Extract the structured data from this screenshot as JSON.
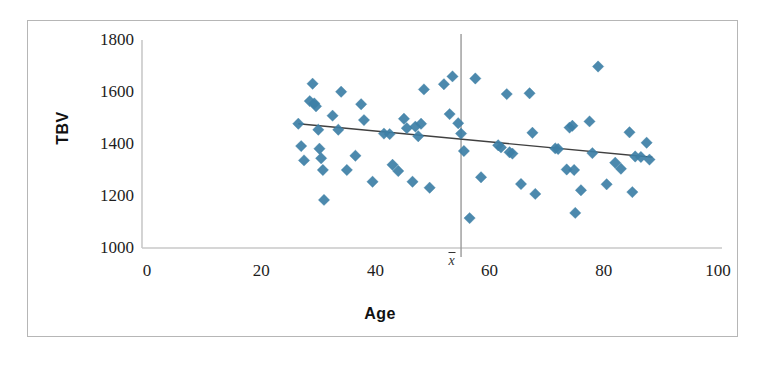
{
  "chart_data": {
    "type": "scatter",
    "title": "",
    "xlabel": "Age",
    "ylabel": "TBV",
    "xlim": [
      0,
      100
    ],
    "ylim": [
      1000,
      1800
    ],
    "xticks": [
      0,
      20,
      40,
      60,
      80,
      100
    ],
    "yticks": [
      1000,
      1200,
      1400,
      1600,
      1800
    ],
    "grid": false,
    "legend": false,
    "marker": "diamond",
    "marker_color": "#3d7fa6",
    "marker_size": 9,
    "annotations": [
      {
        "name": "x-bar-mean-line",
        "kind": "vertical-line",
        "x": 55,
        "label": "x̄",
        "color": "#9a9a9a"
      }
    ],
    "trendline": {
      "name": "regression-line",
      "kind": "line",
      "color": "#404040",
      "x": [
        26.5,
        88.5
      ],
      "y": [
        1478,
        1349
      ],
      "slope": -2.08,
      "intercept": 1533
    },
    "points": [
      {
        "x": 26.5,
        "y": 1478
      },
      {
        "x": 27.0,
        "y": 1392
      },
      {
        "x": 27.5,
        "y": 1337
      },
      {
        "x": 28.5,
        "y": 1565
      },
      {
        "x": 29.0,
        "y": 1632
      },
      {
        "x": 29.3,
        "y": 1556
      },
      {
        "x": 29.6,
        "y": 1545
      },
      {
        "x": 30.0,
        "y": 1455
      },
      {
        "x": 30.2,
        "y": 1382
      },
      {
        "x": 30.5,
        "y": 1345
      },
      {
        "x": 30.8,
        "y": 1300
      },
      {
        "x": 31.0,
        "y": 1185
      },
      {
        "x": 32.5,
        "y": 1509
      },
      {
        "x": 33.5,
        "y": 1455
      },
      {
        "x": 34.0,
        "y": 1601
      },
      {
        "x": 35.0,
        "y": 1300
      },
      {
        "x": 36.5,
        "y": 1355
      },
      {
        "x": 37.5,
        "y": 1553
      },
      {
        "x": 38.0,
        "y": 1492
      },
      {
        "x": 39.5,
        "y": 1255
      },
      {
        "x": 41.5,
        "y": 1440
      },
      {
        "x": 42.5,
        "y": 1438
      },
      {
        "x": 43.0,
        "y": 1320
      },
      {
        "x": 44.0,
        "y": 1296
      },
      {
        "x": 45.0,
        "y": 1497
      },
      {
        "x": 45.5,
        "y": 1461
      },
      {
        "x": 46.5,
        "y": 1255
      },
      {
        "x": 47.0,
        "y": 1467
      },
      {
        "x": 47.5,
        "y": 1430
      },
      {
        "x": 48.0,
        "y": 1478
      },
      {
        "x": 48.5,
        "y": 1610
      },
      {
        "x": 49.5,
        "y": 1232
      },
      {
        "x": 52.0,
        "y": 1630
      },
      {
        "x": 53.0,
        "y": 1515
      },
      {
        "x": 53.5,
        "y": 1660
      },
      {
        "x": 54.5,
        "y": 1480
      },
      {
        "x": 55.0,
        "y": 1440
      },
      {
        "x": 55.5,
        "y": 1373
      },
      {
        "x": 56.5,
        "y": 1115
      },
      {
        "x": 57.5,
        "y": 1652
      },
      {
        "x": 58.5,
        "y": 1272
      },
      {
        "x": 61.5,
        "y": 1395
      },
      {
        "x": 62.0,
        "y": 1387
      },
      {
        "x": 63.0,
        "y": 1592
      },
      {
        "x": 63.5,
        "y": 1368
      },
      {
        "x": 64.0,
        "y": 1363
      },
      {
        "x": 65.5,
        "y": 1246
      },
      {
        "x": 67.0,
        "y": 1595
      },
      {
        "x": 67.5,
        "y": 1443
      },
      {
        "x": 68.0,
        "y": 1208
      },
      {
        "x": 71.5,
        "y": 1383
      },
      {
        "x": 72.0,
        "y": 1381
      },
      {
        "x": 73.5,
        "y": 1302
      },
      {
        "x": 74.0,
        "y": 1463
      },
      {
        "x": 74.5,
        "y": 1470
      },
      {
        "x": 74.8,
        "y": 1300
      },
      {
        "x": 75.0,
        "y": 1135
      },
      {
        "x": 76.0,
        "y": 1222
      },
      {
        "x": 77.5,
        "y": 1487
      },
      {
        "x": 78.0,
        "y": 1365
      },
      {
        "x": 79.0,
        "y": 1698
      },
      {
        "x": 80.5,
        "y": 1245
      },
      {
        "x": 82.0,
        "y": 1328
      },
      {
        "x": 83.0,
        "y": 1305
      },
      {
        "x": 84.5,
        "y": 1445
      },
      {
        "x": 85.0,
        "y": 1215
      },
      {
        "x": 85.5,
        "y": 1352
      },
      {
        "x": 86.5,
        "y": 1350
      },
      {
        "x": 87.5,
        "y": 1405
      },
      {
        "x": 88.0,
        "y": 1340
      }
    ]
  },
  "caption": {
    "partial_text": ""
  }
}
